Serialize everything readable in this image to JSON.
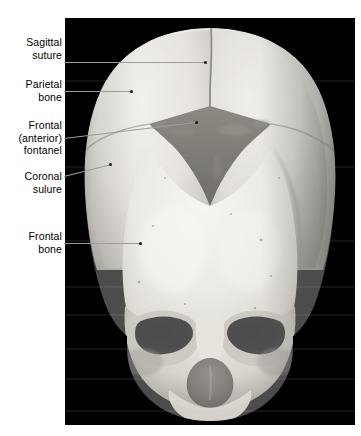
{
  "figure": {
    "kind": "anatomical-photograph",
    "plate_background": "#000000"
  },
  "labels": [
    {
      "id": "sagittal-suture",
      "text": "Sagittal\nsuture",
      "lines": [
        "Sagittal",
        "suture"
      ]
    },
    {
      "id": "parietal-bone",
      "text": "Parietal\nbone",
      "lines": [
        "Parietal",
        "bone"
      ]
    },
    {
      "id": "frontal-anterior-fontanel",
      "text": "Frontal\n(anterior)\nfontanel",
      "lines": [
        "Frontal",
        "(anterior)",
        "fontanel"
      ]
    },
    {
      "id": "coronal-suture",
      "text": "Coronal\nsulure",
      "lines": [
        "Coronal",
        "sulure"
      ]
    },
    {
      "id": "frontal-bone",
      "text": "Frontal\nbone",
      "lines": [
        "Frontal",
        "bone"
      ]
    }
  ],
  "colors": {
    "leader_line": "#9c9c9c",
    "marker_dot": "#1b1b1b",
    "label_text": "#000000",
    "page_background": "#ffffff",
    "bone_light": "#e9e7e2",
    "bone_mid": "#cbc7bf",
    "bone_shadow": "#8f8b84",
    "fontanel_dark": "#4a463f",
    "orbit_black": "#070707"
  }
}
